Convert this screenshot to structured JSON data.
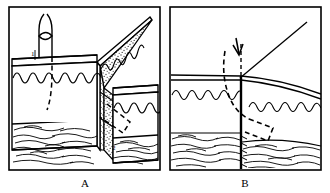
{
  "figure": {
    "panels": [
      {
        "id": "A",
        "caption": "A",
        "type": "3d-block-diagram",
        "description": "Isometric block diagram of two fault blocks separated by a stippled fault plane; wavy line marks the water table, dashed curves show groundwater flow paths, lens pattern at base is bedrock.",
        "annotations": [
          {
            "label": "1",
            "meaning": "upgradient well / recharge point on upthrown block",
            "x": 33,
            "y": 52
          },
          {
            "label": "2",
            "meaning": "downgradient spring / discharge point on downthrown block",
            "x": 113,
            "y": 146
          }
        ],
        "elements": [
          {
            "name": "surface-pipe",
            "meaning": "surface pipe or stream loop above the block"
          },
          {
            "name": "fault-plane",
            "meaning": "stippled fault surface between blocks",
            "fill": "stipple"
          },
          {
            "name": "water-table-left",
            "meaning": "wavy water table line on left block face"
          },
          {
            "name": "water-table-right",
            "meaning": "wavy water table line on right block face"
          },
          {
            "name": "water-table-fault",
            "meaning": "wavy water table line on the fault plane"
          },
          {
            "name": "flow-path-left",
            "meaning": "dashed groundwater flow path descending on left block"
          },
          {
            "name": "flow-path-right",
            "meaning": "dashed groundwater flow path on right block"
          },
          {
            "name": "bedrock-left",
            "meaning": "lens pattern bedrock at base of left block"
          },
          {
            "name": "bedrock-right",
            "meaning": "lens pattern bedrock at base of right block"
          }
        ]
      },
      {
        "id": "B",
        "caption": "B",
        "type": "cross-section",
        "description": "Vertical cross-section through the same fault; heavy vertical line is the fault, wavy lines are the water table stepped down across the fault, dashed curves are flow paths, lens pattern is bedrock.",
        "annotations": [],
        "elements": [
          {
            "name": "down-arrow",
            "meaning": "downward arrow indicating infiltration at the fault"
          },
          {
            "name": "ray-line",
            "meaning": "straight line radiating up-right from the fault trace"
          },
          {
            "name": "fault-line",
            "meaning": "heavy vertical fault trace"
          },
          {
            "name": "ground-surface-left",
            "meaning": "ground surface left of fault"
          },
          {
            "name": "ground-surface-right",
            "meaning": "ground surface right of fault, sloping down"
          },
          {
            "name": "water-table-left",
            "meaning": "wavy water table line left of fault, higher"
          },
          {
            "name": "water-table-right",
            "meaning": "wavy water table line right of fault, lower"
          },
          {
            "name": "flow-path",
            "meaning": "dashed groundwater flow path around the fault"
          },
          {
            "name": "bedrock-left",
            "meaning": "lens pattern bedrock left of fault"
          },
          {
            "name": "bedrock-right",
            "meaning": "lens pattern bedrock right of fault"
          }
        ]
      }
    ],
    "colors": {
      "ink": "#000000",
      "paper": "#ffffff",
      "stipple": "#555555"
    }
  }
}
